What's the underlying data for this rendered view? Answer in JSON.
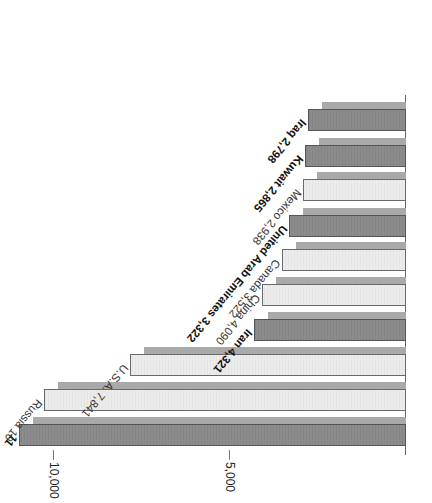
{
  "chart_data": {
    "type": "bar",
    "orientation": "horizontal",
    "rendered_rotation_deg": 180,
    "title": "",
    "xlabel": "",
    "ylabel": "",
    "xlim": [
      0,
      11500
    ],
    "ticks": [
      {
        "value": 5000,
        "label": "5,000"
      },
      {
        "value": 10000,
        "label": "10,000"
      }
    ],
    "grid": false,
    "legend": null,
    "categories": [
      "Saudi Arabia",
      "Russia",
      "U.S.A.",
      "Iran",
      "China",
      "Canada",
      "United Arab Emirates",
      "Mexico",
      "Kuwait",
      "Iraq"
    ],
    "values": [
      11000,
      10270,
      7841,
      4321,
      4090,
      3522,
      3322,
      2938,
      2865,
      2798
    ],
    "bars": [
      {
        "name": "Saudi Arabia",
        "label": "11",
        "value": 11000,
        "style": "dark",
        "bold": true,
        "truncated": true
      },
      {
        "name": "Russia",
        "label": "Russia 10",
        "value": 10270,
        "style": "light",
        "bold": false,
        "truncated": true
      },
      {
        "name": "U.S.A.",
        "label": "U.S.A. 7,841",
        "value": 7841,
        "style": "light",
        "bold": false
      },
      {
        "name": "Iran",
        "label": "Iran 4,321",
        "value": 4321,
        "style": "dark",
        "bold": true
      },
      {
        "name": "China",
        "label": "China 4,090",
        "value": 4090,
        "style": "light",
        "bold": false
      },
      {
        "name": "Canada",
        "label": "Canada 3,522",
        "value": 3522,
        "style": "light",
        "bold": false
      },
      {
        "name": "United Arab Emirates",
        "label": "United Arab Emirates 3,322",
        "value": 3322,
        "style": "dark",
        "bold": true
      },
      {
        "name": "Mexico",
        "label": "Mexico 2,938",
        "value": 2938,
        "style": "light",
        "bold": false
      },
      {
        "name": "Kuwait",
        "label": "Kuwait 2,865",
        "value": 2865,
        "style": "dark",
        "bold": true
      },
      {
        "name": "Iraq",
        "label": "Iraq 2,798",
        "value": 2798,
        "style": "dark",
        "bold": true
      }
    ],
    "colors": {
      "dark": "#8a8a8a",
      "light": "#e9e9e9",
      "shadow": "#a9a9a9",
      "outline": "#555555"
    }
  }
}
